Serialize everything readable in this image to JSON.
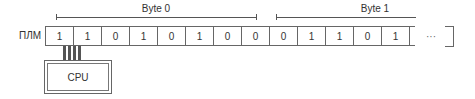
{
  "row_label": "ПЛМ",
  "brackets": [
    {
      "label": "Byte 0",
      "x1": 56,
      "x2": 256,
      "end_tick": true
    },
    {
      "label": "Byte 1",
      "x1": 276,
      "x2": 416,
      "end_tick": false
    }
  ],
  "bits": [
    "1",
    "1",
    "0",
    "1",
    "0",
    "1",
    "0",
    "0",
    "0",
    "1",
    "1",
    "0",
    "1"
  ],
  "ellipsis": "···",
  "cpu_label": "CPU"
}
